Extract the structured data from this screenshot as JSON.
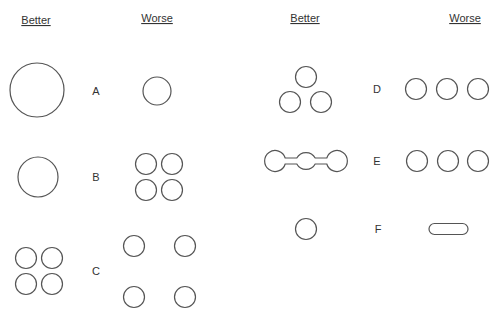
{
  "headers": {
    "left_better": "Better",
    "left_worse": "Worse",
    "right_better": "Better",
    "right_worse": "Worse"
  },
  "rows": [
    {
      "label": "A",
      "better": "one large circle",
      "worse": "one smaller circle"
    },
    {
      "label": "B",
      "better": "one medium circle",
      "worse": "four small circles in 2x2 grid"
    },
    {
      "label": "C",
      "better": "four small circles tightly clustered",
      "worse": "four small circles spread apart"
    },
    {
      "label": "D",
      "better": "three circles in triangle",
      "worse": "three circles in a row"
    },
    {
      "label": "E",
      "better": "three circles connected by bridges",
      "worse": "three separate circles in a row"
    },
    {
      "label": "F",
      "better": "one circle",
      "worse": "elongated pill shape"
    }
  ],
  "colors": {
    "stroke": "#555555",
    "text": "#333333",
    "background": "#ffffff"
  }
}
